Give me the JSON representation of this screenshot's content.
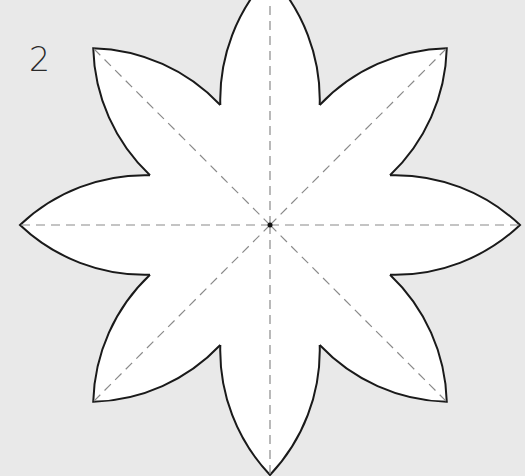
{
  "figure": {
    "label": "2",
    "background_color": "#e9e9e9",
    "petal_fill": "#ffffff",
    "outline_color": "#1a1a1a",
    "fold_line_color": "#8a8a8a",
    "petal_count": 8,
    "center": [
      270,
      225
    ],
    "petal_length": 250,
    "petal_half_width": 50
  }
}
